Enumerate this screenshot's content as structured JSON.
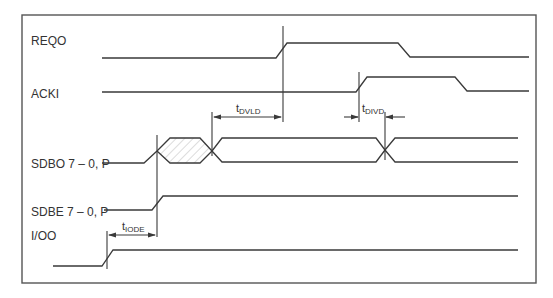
{
  "diagram": {
    "type": "timing-diagram",
    "signals": [
      {
        "id": "reqo",
        "label": "REQO"
      },
      {
        "id": "acki",
        "label": "ACKI"
      },
      {
        "id": "sdbo",
        "label": "SDBO 7 – 0, P"
      },
      {
        "id": "sdbe",
        "label": "SDBE 7 – 0, P"
      },
      {
        "id": "ioo",
        "label": "I/OO"
      }
    ],
    "timings": [
      {
        "id": "tdvld",
        "main": "t",
        "sub": "DVLD"
      },
      {
        "id": "tdivd",
        "main": "t",
        "sub": "DIVD"
      },
      {
        "id": "tiode",
        "main": "t",
        "sub": "IODE"
      }
    ],
    "colors": {
      "line": "#3a3a3a",
      "frame": "#555555",
      "text": "#333333",
      "hatch": "#d8d8d8"
    }
  }
}
